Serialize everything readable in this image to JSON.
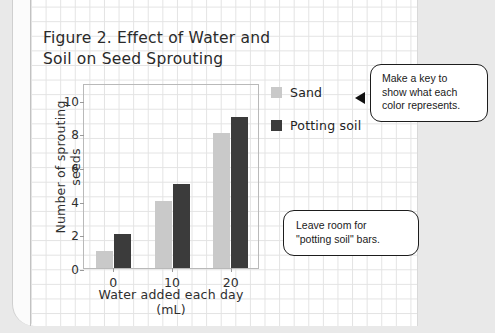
{
  "figure": {
    "title": "Figure 2. Effect of Water and\nSoil on Seed Sprouting"
  },
  "legend": {
    "items": [
      {
        "label": "Sand",
        "color": "#c9c9c9"
      },
      {
        "label": "Potting soil",
        "color": "#3b3b3b"
      }
    ]
  },
  "callouts": [
    {
      "name": "make-a-key",
      "text": "Make a key to\nshow what each\ncolor represents."
    },
    {
      "name": "leave-room",
      "text": "Leave room for\n\"potting soil\" bars."
    }
  ],
  "chart_data": {
    "type": "bar",
    "title": "Figure 2. Effect of Water and Soil on Seed Sprouting",
    "xlabel": "Water added each day (mL)",
    "ylabel": "Number of sprouting seeds",
    "categories": [
      "0",
      "10",
      "20"
    ],
    "series": [
      {
        "name": "Sand",
        "color": "#c9c9c9",
        "values": [
          1,
          4,
          8
        ]
      },
      {
        "name": "Potting soil",
        "color": "#3b3b3b",
        "values": [
          2,
          5,
          9
        ]
      }
    ],
    "ylim": [
      0,
      11
    ],
    "yticks": [
      0,
      2,
      4,
      6,
      8,
      10
    ],
    "ytick_labels": [
      "0",
      "2",
      "4",
      "6",
      "8",
      "10"
    ],
    "xtick_labels": [
      "0",
      "10",
      "20"
    ],
    "grid": false,
    "legend_position": "right"
  }
}
